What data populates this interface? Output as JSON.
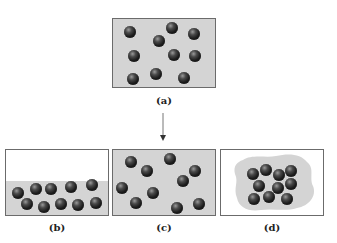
{
  "figure": {
    "panels": [
      {
        "id": "a",
        "label": "(a)",
        "description": "gas molecules spread in gray-filled box"
      },
      {
        "id": "b",
        "label": "(b)",
        "description": "molecules settled as liquid at bottom of box"
      },
      {
        "id": "c",
        "label": "(c)",
        "description": "gas molecules filling entire box"
      },
      {
        "id": "d",
        "label": "(d)",
        "description": "molecules clustered in a solid-like blob"
      }
    ],
    "arrow": "down-arrow",
    "colors": {
      "fill": "#d4d4d4",
      "border": "#6b6b6b",
      "molecule": "#1c1c1c",
      "background": "#ffffff"
    }
  }
}
